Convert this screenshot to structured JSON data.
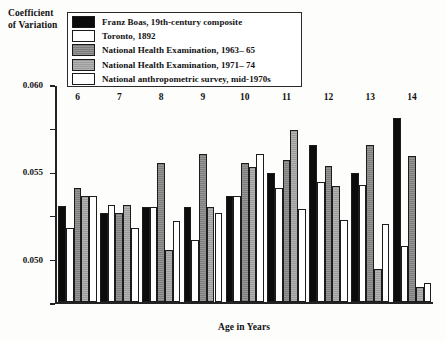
{
  "chart_data": {
    "type": "bar",
    "title": "",
    "ylabel": "Coefficient of Variation",
    "xlabel": "Age in Years",
    "categories": [
      "6",
      "7",
      "8",
      "9",
      "10",
      "11",
      "12",
      "13",
      "14"
    ],
    "ylim": [
      0.035,
      0.06
    ],
    "ytick_labels": [
      "0.035",
      "0.040",
      "0.045",
      "0.050",
      "0.055",
      "0.060"
    ],
    "ytick_values": [
      0.035,
      0.04,
      0.045,
      0.05,
      0.055,
      0.06
    ],
    "grid": false,
    "legend_position": "top-center",
    "series": [
      {
        "name": "Franz Boas, 19th-century composite",
        "color": "#0c0c0c",
        "values": [
          0.0461,
          0.0452,
          0.046,
          0.046,
          0.0472,
          0.0498,
          0.053,
          0.0498,
          0.0562
        ]
      },
      {
        "name": "Toronto, 1892",
        "color": "#ffffff",
        "values": [
          0.0435,
          0.0462,
          0.046,
          0.0422,
          0.0472,
          0.0481,
          0.0488,
          0.0485,
          0.0415
        ]
      },
      {
        "name": "National Health Examination, 1963– 65",
        "color": "#8b8b8b",
        "values": [
          0.0481,
          0.0452,
          0.051,
          0.052,
          0.051,
          0.0513,
          0.0506,
          0.053,
          0.0518
        ]
      },
      {
        "name": "National Health Examination, 1971– 74",
        "color": "#a9a9a9",
        "values": [
          0.0472,
          0.0462,
          0.041,
          0.046,
          0.0505,
          0.0548,
          0.0483,
          0.0388,
          0.0368
        ]
      },
      {
        "name": "National anthropometric survey, mid-1970s",
        "color": "#ffffff",
        "values": [
          0.0472,
          0.0435,
          0.0443,
          0.0452,
          0.052,
          0.0457,
          0.0445,
          0.044,
          0.0372
        ]
      }
    ]
  },
  "axis": {
    "y_title_line1": "Coefficient",
    "y_title_line2": "of Variation",
    "x_title": "Age in Years"
  }
}
